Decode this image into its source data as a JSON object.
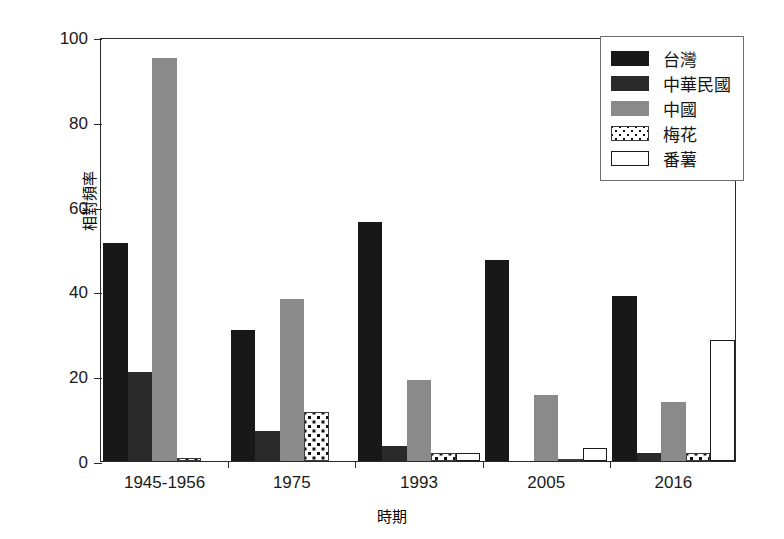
{
  "chart_data": {
    "type": "bar",
    "title": "",
    "subtitle": "",
    "xlabel": "時期",
    "ylabel": "相對頻率",
    "categories": [
      "1945-1956",
      "1975",
      "1993",
      "2005",
      "2016"
    ],
    "ylim": [
      0,
      100
    ],
    "yticks": [
      0,
      20,
      40,
      60,
      80,
      100
    ],
    "ytick_labels": [
      "0",
      "20",
      "40",
      "60",
      "80",
      "100"
    ],
    "grid": false,
    "legend_position": "top-right",
    "series": [
      {
        "name": "台灣",
        "fill": "black",
        "color": "#181818",
        "values": [
          51.5,
          31.0,
          56.3,
          47.5,
          39.0
        ]
      },
      {
        "name": "中華民國",
        "fill": "black-dark",
        "color": "#2a2a2a",
        "values": [
          21.0,
          7.0,
          3.5,
          0.0,
          2.0
        ]
      },
      {
        "name": "中國",
        "fill": "gray",
        "color": "#8a8a8a",
        "values": [
          95.0,
          38.2,
          19.0,
          15.5,
          14.0
        ]
      },
      {
        "name": "梅花",
        "fill": "dotted",
        "color": "#ffffff",
        "values": [
          0.8,
          11.5,
          1.9,
          0.5,
          2.0
        ]
      },
      {
        "name": "番薯",
        "fill": "white",
        "color": "#ffffff",
        "values": [
          0.0,
          0.0,
          1.8,
          3.0,
          28.5
        ]
      }
    ]
  },
  "axes": {
    "y_axis_name": "y-axis",
    "x_axis_name": "x-axis"
  }
}
